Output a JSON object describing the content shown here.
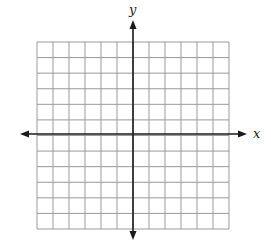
{
  "diagram": {
    "type": "coordinate-plane",
    "grid": {
      "columns": 12,
      "rows": 12,
      "left": 37,
      "top": 42,
      "right": 229,
      "bottom": 229,
      "line_color": "#9a9a9a"
    },
    "axes": {
      "color": "#1a1a1a",
      "x_axis": {
        "label": "x",
        "y": 134,
        "from": 20,
        "to": 247
      },
      "y_axis": {
        "label": "y",
        "x": 133,
        "from": 20,
        "to": 240
      }
    }
  }
}
